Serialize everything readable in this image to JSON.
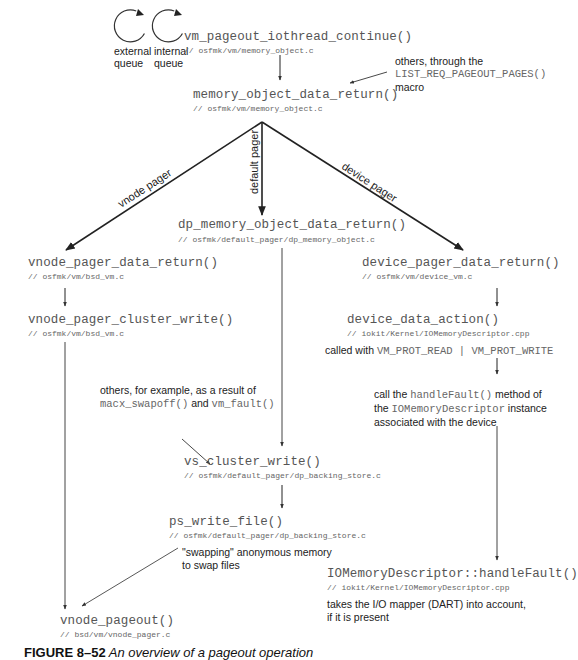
{
  "queues": {
    "external": {
      "line1": "external",
      "line2": "queue",
      "icon": "circular-arrow-icon"
    },
    "internal": {
      "line1": "internal",
      "line2": "queue",
      "icon": "circular-arrow-icon"
    }
  },
  "nodes": {
    "iothread": {
      "fn": "vm_pageout_iothread_continue()",
      "path": "// osfmk/vm/memory_object.c"
    },
    "mo_return": {
      "fn": "memory_object_data_return()",
      "path": "// osfmk/vm/memory_object.c"
    },
    "dp_return": {
      "fn": "dp_memory_object_data_return()",
      "path": "// osfmk/default_pager/dp_memory_object.c"
    },
    "vnode_return": {
      "fn": "vnode_pager_data_return()",
      "path": "// osfmk/vm/bsd_vm.c"
    },
    "vnode_cluster": {
      "fn": "vnode_pager_cluster_write()",
      "path": "// osfmk/vm/bsd_vm.c"
    },
    "device_return": {
      "fn": "device_pager_data_return()",
      "path": "// osfmk/vm/device_vm.c"
    },
    "device_action": {
      "fn": "device_data_action()",
      "path": "// iokit/Kernel/IOMemoryDescriptor.cpp"
    },
    "vs_cluster": {
      "fn": "vs_cluster_write()",
      "path": "// osfmk/default_pager/dp_backing_store.c"
    },
    "ps_write": {
      "fn": "ps_write_file()",
      "path": "// osfmk/default_pager/dp_backing_store.c"
    },
    "handle_fault": {
      "fn": "IOMemoryDescriptor::handleFault()",
      "path": "// iokit/Kernel/IOMemoryDescriptor.cpp"
    },
    "vnode_pageout": {
      "fn": "vnode_pageout()",
      "path": "// bsd/vm/vnode_pager.c"
    }
  },
  "edge_labels": {
    "vnode": "vnode pager",
    "default": "default pager",
    "device": "device pager"
  },
  "notes": {
    "others_macro": {
      "line1": "others, through the",
      "code": "LIST_REQ_PAGEOUT_PAGES()",
      "line3": "macro"
    },
    "others_swap": {
      "line1": "others, for example, as a result of",
      "code1": "macx_swapoff()",
      "and": " and ",
      "code2": "vm_fault()"
    },
    "called_with": {
      "text": "called with ",
      "code": "VM_PROT_READ | VM_PROT_WRITE"
    },
    "handle_fault_desc": {
      "t1": "call the ",
      "c1": "handleFault()",
      "t2": " method of",
      "t3": "the ",
      "c2": "IOMemoryDescriptor",
      "t4": " instance",
      "t5": "associated with the device"
    },
    "swapping": {
      "line1": "\"swapping\" anonymous memory",
      "line2": "to swap files"
    },
    "dart": {
      "line1": "takes the I/O mapper (DART) into account,",
      "line2": "if it is present"
    }
  },
  "caption": {
    "label": "FIGURE 8–52",
    "text": " An overview of a pageout operation"
  }
}
